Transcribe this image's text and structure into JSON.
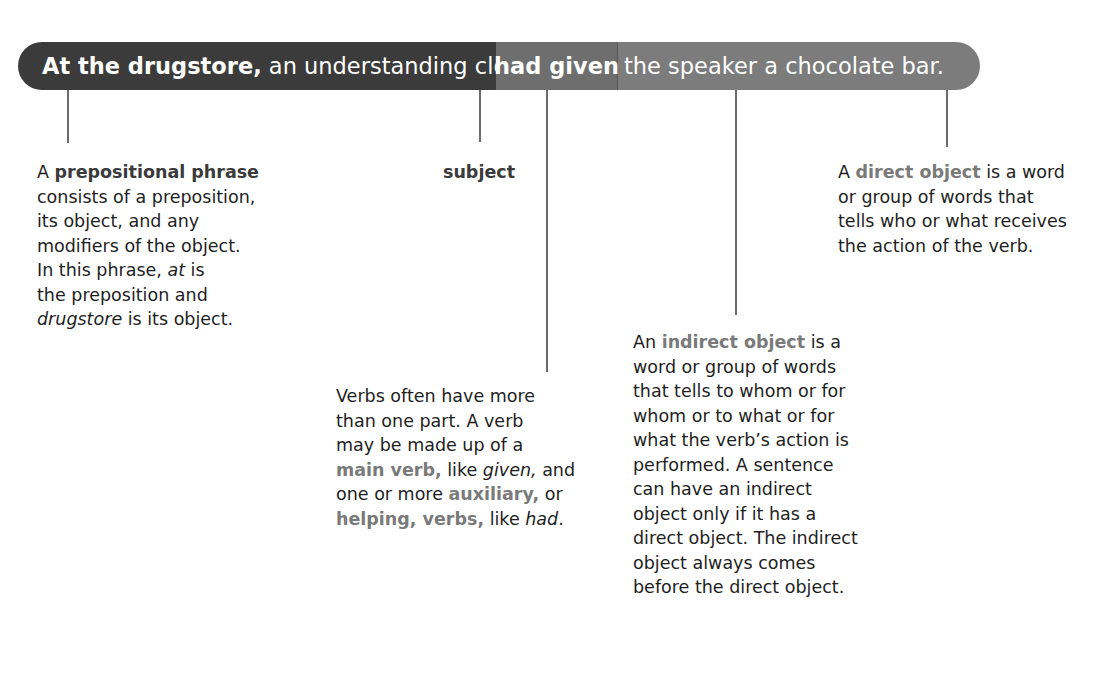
{
  "sentence": {
    "seg1_bold": "At the drugstore,",
    "seg1_rest": " an understanding clerk ",
    "seg2": "had given",
    "seg3": "the speaker a chocolate bar."
  },
  "colors": {
    "bar_dark": "#3b3b3b",
    "bar_verb": "#6e6e6e",
    "bar_light": "#7c7c7c",
    "term_highlight": "#7a7a7a",
    "connector": "#6a6a6a"
  },
  "annotations": {
    "prepositional": {
      "lead": "A ",
      "term": "prepositional phrase",
      "l1": "consists of a preposition,",
      "l2": "its object, and any",
      "l3": "modifiers of the object.",
      "l4_pre": "In this phrase, ",
      "l4_it": "at",
      "l4_post": " is",
      "l5": "the preposition and",
      "l6_it": "drugstore",
      "l6_post": " is its object."
    },
    "subject": {
      "term": "subject"
    },
    "verb": {
      "l1": "Verbs often have more",
      "l2": "than one part.  A verb",
      "l3": "may be made up of a",
      "l4_term": "main verb,",
      "l4_mid": " like ",
      "l4_it": "given,",
      "l4_post": " and",
      "l5_pre": "one or more ",
      "l5_term": "auxiliary,",
      "l5_post": " or",
      "l6_term": "helping, verbs,",
      "l6_mid": " like ",
      "l6_it": "had",
      "l6_post": "."
    },
    "indirect": {
      "lead": "An ",
      "term": "indirect object",
      "l1_post": " is a",
      "l2": "word or group of words",
      "l3": "that tells to whom or for",
      "l4": "whom or to what or for",
      "l5": "what the verb’s action is",
      "l6": "performed.  A sentence",
      "l7": "can have an indirect",
      "l8": "object only if it has a",
      "l9": "direct object.  The indirect",
      "l10": "object always comes",
      "l11": "before the direct object."
    },
    "direct": {
      "lead": "A ",
      "term": "direct object",
      "l1_post": " is a word",
      "l2": "or group of words that",
      "l3": "tells who or what receives",
      "l4": "the action of the verb."
    }
  }
}
